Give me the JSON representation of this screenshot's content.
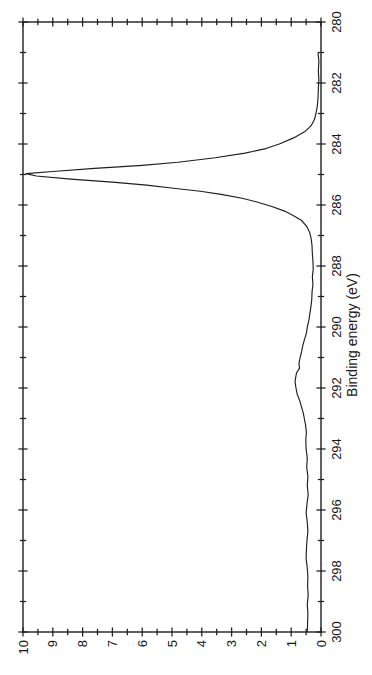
{
  "figure": {
    "background": "#ffffff",
    "ink_color": "#1e1e1e",
    "rotated_deg": -90
  },
  "chart_data": {
    "type": "line",
    "title": "",
    "xlabel": "Binding energy (eV)",
    "ylabel": "",
    "xlim": [
      280,
      300
    ],
    "x_axis_high_value_at_left": true,
    "ylim": [
      0,
      10
    ],
    "x_tick_labels": [
      280,
      282,
      284,
      286,
      288,
      290,
      292,
      294,
      296,
      298,
      300
    ],
    "x_minor_tick_step": 1,
    "y_tick_labels": [
      0,
      1,
      2,
      3,
      4,
      5,
      6,
      7,
      8,
      9,
      10
    ],
    "y_minor_tick_step": 0.5,
    "grid": false,
    "legend": "none",
    "series": [
      {
        "name": "C 1s XPS spectrum",
        "peak_center_eV": 285.0,
        "peak_height": 9.9,
        "satellite_bump_eV": 291.8,
        "satellite_height": 0.87,
        "points": [
          [
            281.0,
            0.1
          ],
          [
            281.3,
            0.07
          ],
          [
            281.6,
            0.09
          ],
          [
            281.9,
            0.07
          ],
          [
            282.2,
            0.09
          ],
          [
            282.5,
            0.1
          ],
          [
            282.8,
            0.13
          ],
          [
            283.0,
            0.17
          ],
          [
            283.2,
            0.22
          ],
          [
            283.4,
            0.33
          ],
          [
            283.6,
            0.55
          ],
          [
            283.8,
            0.92
          ],
          [
            284.0,
            1.4
          ],
          [
            284.15,
            1.85
          ],
          [
            284.3,
            2.55
          ],
          [
            284.45,
            3.55
          ],
          [
            284.6,
            4.8
          ],
          [
            284.7,
            6.0
          ],
          [
            284.8,
            7.6
          ],
          [
            284.9,
            9.0
          ],
          [
            284.97,
            9.9
          ],
          [
            285.05,
            9.55
          ],
          [
            285.15,
            8.4
          ],
          [
            285.25,
            7.0
          ],
          [
            285.35,
            5.85
          ],
          [
            285.45,
            4.95
          ],
          [
            285.55,
            4.05
          ],
          [
            285.65,
            3.35
          ],
          [
            285.78,
            2.65
          ],
          [
            285.9,
            2.15
          ],
          [
            286.05,
            1.65
          ],
          [
            286.2,
            1.22
          ],
          [
            286.35,
            0.92
          ],
          [
            286.5,
            0.66
          ],
          [
            286.7,
            0.48
          ],
          [
            286.9,
            0.38
          ],
          [
            287.1,
            0.33
          ],
          [
            287.35,
            0.3
          ],
          [
            287.6,
            0.29
          ],
          [
            287.85,
            0.27
          ],
          [
            288.1,
            0.26
          ],
          [
            288.35,
            0.29
          ],
          [
            288.6,
            0.27
          ],
          [
            288.85,
            0.3
          ],
          [
            289.1,
            0.31
          ],
          [
            289.35,
            0.34
          ],
          [
            289.6,
            0.38
          ],
          [
            289.8,
            0.41
          ],
          [
            290.0,
            0.46
          ],
          [
            290.2,
            0.49
          ],
          [
            290.4,
            0.55
          ],
          [
            290.6,
            0.61
          ],
          [
            290.8,
            0.65
          ],
          [
            291.0,
            0.7
          ],
          [
            291.2,
            0.74
          ],
          [
            291.35,
            0.72
          ],
          [
            291.5,
            0.82
          ],
          [
            291.65,
            0.85
          ],
          [
            291.8,
            0.87
          ],
          [
            292.0,
            0.84
          ],
          [
            292.2,
            0.8
          ],
          [
            292.4,
            0.72
          ],
          [
            292.6,
            0.66
          ],
          [
            292.8,
            0.6
          ],
          [
            293.0,
            0.56
          ],
          [
            293.2,
            0.52
          ],
          [
            293.45,
            0.49
          ],
          [
            293.7,
            0.51
          ],
          [
            294.0,
            0.5
          ],
          [
            294.3,
            0.46
          ],
          [
            294.6,
            0.48
          ],
          [
            294.9,
            0.44
          ],
          [
            295.2,
            0.46
          ],
          [
            295.5,
            0.43
          ],
          [
            295.8,
            0.47
          ],
          [
            296.1,
            0.5
          ],
          [
            296.4,
            0.46
          ],
          [
            296.7,
            0.44
          ],
          [
            297.0,
            0.47
          ],
          [
            297.3,
            0.49
          ],
          [
            297.6,
            0.5
          ],
          [
            297.9,
            0.46
          ],
          [
            298.2,
            0.44
          ],
          [
            298.5,
            0.45
          ],
          [
            298.8,
            0.43
          ],
          [
            299.1,
            0.46
          ],
          [
            299.4,
            0.44
          ],
          [
            299.7,
            0.45
          ],
          [
            300.0,
            0.46
          ]
        ]
      }
    ]
  }
}
